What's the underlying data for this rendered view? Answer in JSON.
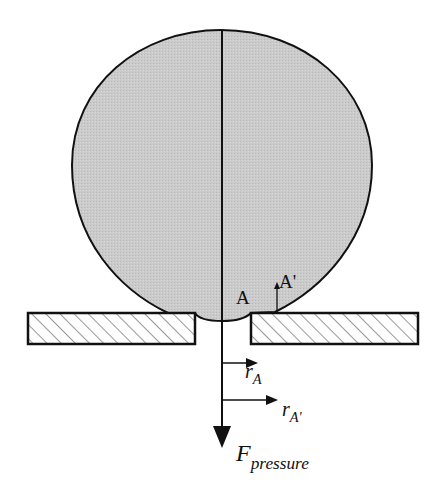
{
  "diagram": {
    "title": "",
    "labels": {
      "point_a": "A",
      "point_a_prime": "A'",
      "r_a_main": "r",
      "r_a_sub": "A",
      "r_a_prime_main": "r",
      "r_a_prime_sub": "A'",
      "force_main": "F",
      "force_sub": "pressure"
    },
    "colors": {
      "droplet_fill": "#c8c8c8",
      "stroke": "#111111",
      "hatch": "#333333",
      "background": "#ffffff"
    },
    "elements": {
      "droplet": "large grey blob resting on two plates, bulging through gap",
      "left_plate": "hatched rectangular plate (left)",
      "right_plate": "hatched rectangular plate (right)",
      "axis_line": "vertical center line through droplet",
      "force_arrow": "downward pressure force arrow",
      "radius_arrows": [
        "r_A",
        "r_A'"
      ]
    }
  }
}
